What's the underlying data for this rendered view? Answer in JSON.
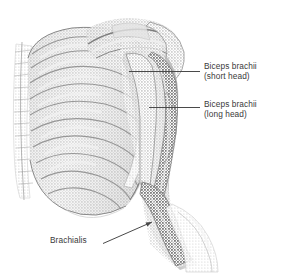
{
  "figure": {
    "type": "anatomical-illustration",
    "style": "grayscale halftone line drawing",
    "background_color": "#ffffff",
    "ink_color": "#8c8c8c",
    "text_color": "#3a3a3a",
    "leader_color": "#4a4a4a"
  },
  "labels": {
    "short_head": {
      "line1": "Biceps brachii",
      "line2": "(short head)"
    },
    "long_head": {
      "line1": "Biceps brachii",
      "line2": "(long head)"
    },
    "brachialis": {
      "line1": "Brachialis"
    }
  },
  "structures": [
    {
      "name": "ribcage",
      "label": ""
    },
    {
      "name": "sternum",
      "label": ""
    },
    {
      "name": "clavicle",
      "label": ""
    },
    {
      "name": "scapula",
      "label": ""
    },
    {
      "name": "humerus",
      "label": ""
    },
    {
      "name": "biceps-brachii-short-head",
      "label": "Biceps brachii (short head)"
    },
    {
      "name": "biceps-brachii-long-head",
      "label": "Biceps brachii (long head)"
    },
    {
      "name": "brachialis",
      "label": "Brachialis"
    },
    {
      "name": "forearm",
      "label": ""
    }
  ]
}
